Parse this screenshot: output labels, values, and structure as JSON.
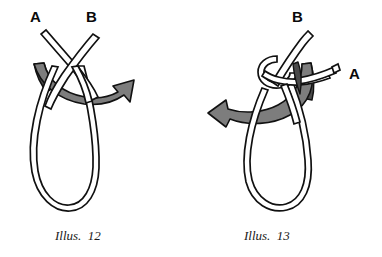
{
  "document": {
    "type": "knot-tying-instructional-diagram",
    "background_color": "#ffffff",
    "ink_color": "#111111",
    "arrow_color": "#7d7d7d",
    "arrow_shadow_color": "#4a4a4a"
  },
  "figures": [
    {
      "id": "illus-12",
      "caption": "Illus.  12",
      "caption_number": "12",
      "description": "Two rope ends crossed in an X above a hanging loop, with a gray curved arrow sweeping to the right",
      "labels": [
        {
          "text": "A",
          "position": "upper-left"
        },
        {
          "text": "B",
          "position": "upper-right"
        }
      ],
      "arrow": {
        "name": "curved-arrow-right",
        "direction": "right",
        "color": "#7d7d7d"
      }
    },
    {
      "id": "illus-13",
      "caption": "Illus.  13",
      "caption_number": "13",
      "description": "An overhand knot formed at the top of the loop with one end passed through, and a gray curved arrow sweeping to the left",
      "labels": [
        {
          "text": "B",
          "position": "top"
        },
        {
          "text": "A",
          "position": "right"
        }
      ],
      "arrow": {
        "name": "curved-arrow-left",
        "direction": "left",
        "color": "#7d7d7d"
      }
    }
  ]
}
